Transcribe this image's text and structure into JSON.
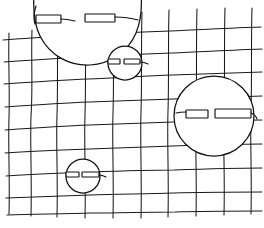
{
  "image": {
    "title": "Hand-drawn grid with circular faces",
    "description": "A sketch of a wobbly hand-drawn grid of vertical and horizontal lines, overlaid with four white circular shapes, each containing two horizontal rectangular eye slits.",
    "width": 264,
    "height": 228,
    "background_color": "#ffffff",
    "ink_color": "#111111",
    "grid_color": "#1a1a1a",
    "style": "pencil-sketch"
  },
  "grid": {
    "name": "hand-drawn-grid",
    "vertical_count": 10,
    "horizontal_count": 9,
    "vertical_x": [
      9,
      31,
      57,
      85,
      113,
      141,
      168,
      196,
      224,
      251
    ],
    "horizontal_y": [
      37,
      58,
      80,
      103,
      126,
      149,
      172,
      195,
      213
    ]
  },
  "shapes": [
    {
      "name": "face-top-left",
      "label": "large clipped circle top-left",
      "cx": 88,
      "cy": 8,
      "r": 54,
      "eyes": [
        {
          "name": "eye-left",
          "x": 36,
          "y": 15,
          "w": 25,
          "h": 8,
          "tail": false
        },
        {
          "name": "eye-right",
          "x": 85,
          "y": 14,
          "w": 30,
          "h": 8,
          "tail": true
        }
      ]
    },
    {
      "name": "face-upper-middle",
      "label": "small circle upper-middle",
      "cx": 125,
      "cy": 63,
      "r": 17,
      "eyes": [
        {
          "name": "eye-left",
          "x": 108,
          "y": 59,
          "w": 12,
          "h": 5,
          "tail": false
        },
        {
          "name": "eye-right",
          "x": 124,
          "y": 59,
          "w": 16,
          "h": 5,
          "tail": true
        }
      ]
    },
    {
      "name": "face-right-large",
      "label": "large circle right",
      "cx": 214,
      "cy": 116,
      "r": 40,
      "eyes": [
        {
          "name": "eye-left",
          "x": 186,
          "y": 110,
          "w": 22,
          "h": 8,
          "tail": false
        },
        {
          "name": "eye-right",
          "x": 215,
          "y": 109,
          "w": 36,
          "h": 9,
          "tail": true
        }
      ]
    },
    {
      "name": "face-bottom-left",
      "label": "small circle bottom-left",
      "cx": 83,
      "cy": 176,
      "r": 17,
      "eyes": [
        {
          "name": "eye-left",
          "x": 66,
          "y": 172,
          "w": 13,
          "h": 5,
          "tail": false
        },
        {
          "name": "eye-right",
          "x": 82,
          "y": 172,
          "w": 17,
          "h": 5,
          "tail": true
        }
      ]
    }
  ]
}
